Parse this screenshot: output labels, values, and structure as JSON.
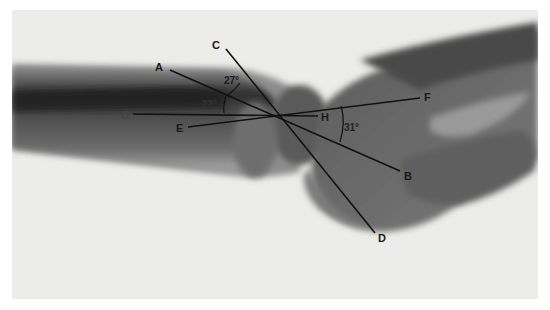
{
  "figure": {
    "type": "radiograph",
    "colors": {
      "background": "#ececea",
      "bone_dark": "#3a3a3a",
      "bone_mid": "#6a6a6a",
      "soft_tissue": "#9a9a9a",
      "line": "#111111",
      "text": "#1a1a1a"
    },
    "intersection": [
      278,
      115
    ],
    "lines": [
      {
        "id": "AB",
        "from": "A",
        "to": "B",
        "x1": 170,
        "y1": 70,
        "x2": 400,
        "y2": 171
      },
      {
        "id": "CD",
        "from": "C",
        "to": "D",
        "x1": 226,
        "y1": 49,
        "x2": 375,
        "y2": 233
      },
      {
        "id": "GH",
        "from": "G",
        "to": "H",
        "x1": 133,
        "y1": 114,
        "x2": 318,
        "y2": 116
      },
      {
        "id": "EF",
        "from": "E",
        "to": "F",
        "x1": 188,
        "y1": 127,
        "x2": 420,
        "y2": 98
      }
    ],
    "point_labels": [
      {
        "text": "A",
        "x": 155,
        "y": 62
      },
      {
        "text": "B",
        "x": 404,
        "y": 171
      },
      {
        "text": "C",
        "x": 212,
        "y": 40
      },
      {
        "text": "D",
        "x": 378,
        "y": 233
      },
      {
        "text": "E",
        "x": 176,
        "y": 123
      },
      {
        "text": "F",
        "x": 424,
        "y": 92
      },
      {
        "text": "G",
        "x": 121,
        "y": 110
      },
      {
        "text": "H",
        "x": 321,
        "y": 112
      }
    ],
    "angle_labels": [
      {
        "text": "27°",
        "x": 224,
        "y": 76
      },
      {
        "text": "22°",
        "x": 202,
        "y": 100
      },
      {
        "text": "31°",
        "x": 344,
        "y": 123
      }
    ]
  }
}
